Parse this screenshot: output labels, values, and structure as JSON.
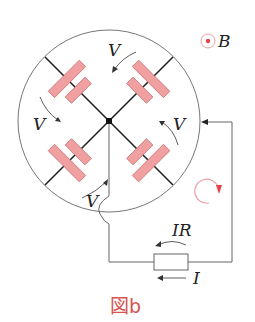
{
  "figure": {
    "caption": "図b",
    "labels": {
      "field": "B",
      "v_top": "V",
      "v_left": "V",
      "v_right": "V",
      "v_bottom": "V",
      "ir": "IR",
      "current": "I"
    },
    "icons": {
      "field_symbol": "dot-in-circle-out-of-page",
      "circulation": "clockwise-arrow"
    },
    "colors": {
      "plate_fill": "#f0a0a0",
      "plate_stroke": "#c97070",
      "accent_red": "#e8404a",
      "wire": "#333333",
      "circle": "#555555",
      "caption": "#d9534f"
    }
  }
}
